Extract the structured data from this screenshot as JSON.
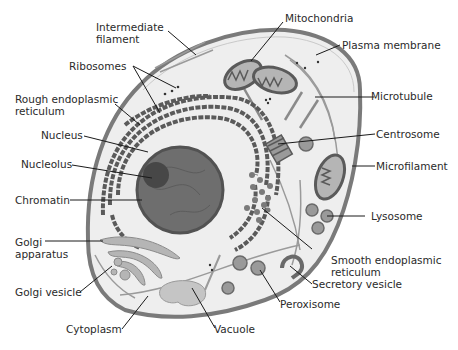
{
  "colors": {
    "membrane": "#7a7a7a",
    "cytoplasm": "#eeeeee",
    "organelle_fill": "#b5b5b5",
    "organelle_dark": "#5a5a5a",
    "nucleus": "#6e6e6e",
    "nucleolus": "#474747",
    "leader_line": "#1a1a1a",
    "text": "#2a2a2a"
  },
  "labels": {
    "intermediate_filament": [
      "Intermediate",
      "filament"
    ],
    "ribosomes": "Ribosomes",
    "rough_er": [
      "Rough endoplasmic",
      "reticulum"
    ],
    "nucleus": "Nucleus",
    "nucleolus": "Nucleolus",
    "chromatin": "Chromatin",
    "golgi_apparatus": [
      "Golgi",
      "apparatus"
    ],
    "golgi_vesicle": "Golgi vesicle",
    "cytoplasm": "Cytoplasm",
    "vacuole": "Vacuole",
    "peroxisome": "Peroxisome",
    "secretory_vesicle": "Secretory vesicle",
    "smooth_er": [
      "Smooth endoplasmic",
      "reticulum"
    ],
    "lysosome": "Lysosome",
    "microfilament": "Microfilament",
    "centrosome": "Centrosome",
    "microtubule": "Microtubule",
    "plasma_membrane": "Plasma membrane",
    "mitochondria": "Mitochondria"
  }
}
